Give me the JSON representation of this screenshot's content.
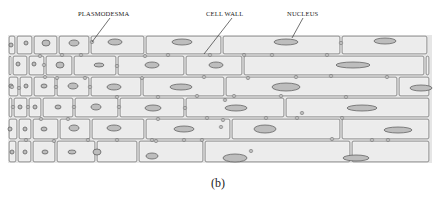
{
  "figure": {
    "caption": "(b)",
    "colors": {
      "tissue_fill": "#e6e6e6",
      "cell_fill": "#ececec",
      "wall_stroke": "#6a6a6a",
      "wall_highlight": "#f7f7f7",
      "nucleus_fill": "#bdbdbd",
      "nucleus_stroke": "#555555",
      "label_text": "#222222"
    },
    "tissue": {
      "x": 8,
      "y": 35,
      "width": 424,
      "height": 128
    },
    "labels": [
      {
        "text": "PLASMODESMA",
        "x": 78,
        "y": 10,
        "line": [
          110,
          18,
          92,
          42
        ]
      },
      {
        "text": "CELL WALL",
        "x": 206,
        "y": 10,
        "line": [
          232,
          18,
          204,
          54
        ]
      },
      {
        "text": "NUCLEUS",
        "x": 287,
        "y": 10,
        "line": [
          303,
          18,
          292,
          38
        ]
      }
    ],
    "rows": [
      {
        "y": 35,
        "h": 20,
        "cells": [
          {
            "x": 8,
            "w": 8,
            "nucleus": [
              11,
              45,
              2,
              2
            ]
          },
          {
            "x": 16,
            "w": 17,
            "nucleus": [
              26,
              43,
              2,
              2
            ]
          },
          {
            "x": 33,
            "w": 25,
            "nucleus": [
              46,
              43,
              4,
              3
            ]
          },
          {
            "x": 58,
            "w": 32,
            "nucleus": [
              74,
              43,
              5,
              3
            ]
          },
          {
            "x": 90,
            "w": 55,
            "nucleus": [
              115,
              42,
              7,
              3
            ]
          },
          {
            "x": 145,
            "w": 77,
            "nucleus": [
              182,
              42,
              10,
              3
            ]
          },
          {
            "x": 222,
            "w": 119,
            "nucleus": [
              286,
              42,
              12,
              3
            ]
          },
          {
            "x": 341,
            "w": 87,
            "nucleus": [
              385,
              41,
              11,
              3
            ]
          }
        ]
      },
      {
        "y": 55,
        "h": 21,
        "cells": [
          {
            "x": 8,
            "w": 4,
            "nucleus": null
          },
          {
            "x": 12,
            "w": 16,
            "nucleus": [
              18,
              64,
              2,
              2
            ]
          },
          {
            "x": 28,
            "w": 17,
            "nucleus": [
              34,
              64,
              2,
              2
            ]
          },
          {
            "x": 45,
            "w": 28,
            "nucleus": [
              60,
              65,
              4,
              3
            ]
          },
          {
            "x": 73,
            "w": 44,
            "nucleus": [
              99,
              65,
              5,
              2
            ]
          },
          {
            "x": 117,
            "w": 68,
            "nucleus": [
              152,
              65,
              7,
              3
            ]
          },
          {
            "x": 185,
            "w": 58,
            "nucleus": [
              216,
              65,
              7,
              3
            ]
          },
          {
            "x": 243,
            "w": 182,
            "nucleus": [
              353,
              65,
              17,
              3
            ]
          },
          {
            "x": 425,
            "w": 5,
            "nucleus": null
          }
        ]
      },
      {
        "y": 76,
        "h": 21,
        "cells": [
          {
            "x": 8,
            "w": 11,
            "nucleus": [
              11,
              86,
              2,
              2
            ]
          },
          {
            "x": 19,
            "w": 14,
            "nucleus": [
              26,
              86,
              2,
              2
            ]
          },
          {
            "x": 33,
            "w": 23,
            "nucleus": [
              44,
              86,
              3,
              2
            ]
          },
          {
            "x": 56,
            "w": 34,
            "nucleus": [
              73,
              86,
              5,
              3
            ]
          },
          {
            "x": 90,
            "w": 52,
            "nucleus": [
              114,
              87,
              7,
              3
            ]
          },
          {
            "x": 142,
            "w": 83,
            "nucleus": [
              181,
              87,
              11,
              3
            ]
          },
          {
            "x": 225,
            "w": 173,
            "nucleus": [
              286,
              87,
              14,
              4
            ]
          },
          {
            "x": 398,
            "w": 32,
            "nucleus": [
              421,
              88,
              11,
              3
            ]
          }
        ]
      },
      {
        "y": 97,
        "h": 21,
        "cells": [
          {
            "x": 8,
            "w": 5,
            "nucleus": null
          },
          {
            "x": 13,
            "w": 15,
            "nucleus": [
              20,
              107,
              2,
              2
            ]
          },
          {
            "x": 28,
            "w": 14,
            "nucleus": [
              35,
              107,
              2,
              2
            ]
          },
          {
            "x": 42,
            "w": 32,
            "nucleus": [
              58,
              107,
              3,
              2
            ]
          },
          {
            "x": 74,
            "w": 45,
            "nucleus": [
              96,
              107,
              5,
              3
            ]
          },
          {
            "x": 119,
            "w": 66,
            "nucleus": [
              153,
              108,
              8,
              3
            ]
          },
          {
            "x": 185,
            "w": 100,
            "nucleus": [
              236,
              108,
              11,
              3
            ]
          },
          {
            "x": 285,
            "w": 145,
            "nucleus": [
              362,
              108,
              15,
              3
            ]
          }
        ]
      },
      {
        "y": 118,
        "h": 22,
        "cells": [
          {
            "x": 8,
            "w": 10,
            "nucleus": [
              10,
              129,
              2,
              2
            ]
          },
          {
            "x": 18,
            "w": 14,
            "nucleus": [
              25,
              129,
              2,
              2
            ]
          },
          {
            "x": 32,
            "w": 27,
            "nucleus": [
              44,
              129,
              3,
              2
            ]
          },
          {
            "x": 59,
            "w": 32,
            "nucleus": [
              74,
              128,
              5,
              3
            ]
          },
          {
            "x": 91,
            "w": 54,
            "nucleus": [
              114,
              128,
              7,
              3
            ]
          },
          {
            "x": 145,
            "w": 86,
            "nucleus": [
              184,
              129,
              10,
              3
            ]
          },
          {
            "x": 231,
            "w": 110,
            "nucleus": [
              265,
              129,
              11,
              4
            ]
          },
          {
            "x": 341,
            "w": 89,
            "nucleus": [
              398,
              130,
              14,
              3
            ]
          }
        ]
      },
      {
        "y": 140,
        "h": 23,
        "cells": [
          {
            "x": 8,
            "w": 9,
            "nucleus": [
              12,
              152,
              2,
              2
            ]
          },
          {
            "x": 17,
            "w": 15,
            "nucleus": [
              25,
              152,
              2,
              2
            ]
          },
          {
            "x": 32,
            "w": 24,
            "nucleus": [
              45,
              152,
              3,
              2
            ]
          },
          {
            "x": 56,
            "w": 40,
            "nucleus": [
              72,
              152,
              4,
              2
            ]
          },
          {
            "x": 96,
            "w": 42,
            "nucleus": [
              97,
              152,
              4,
              3
            ]
          },
          {
            "x": 138,
            "w": 66,
            "nucleus": [
              152,
              156,
              6,
              3
            ]
          },
          {
            "x": 204,
            "w": 147,
            "nucleus": [
              235,
              158,
              12,
              4
            ]
          },
          {
            "x": 351,
            "w": 79,
            "nucleus": [
              356,
              158,
              13,
              3
            ]
          }
        ]
      }
    ],
    "plasmodesmata": [
      [
        92,
        42
      ],
      [
        40,
        56
      ],
      [
        44,
        65
      ],
      [
        62,
        55
      ],
      [
        81,
        55
      ],
      [
        117,
        66
      ],
      [
        145,
        56
      ],
      [
        168,
        55
      ],
      [
        210,
        55
      ],
      [
        244,
        55
      ],
      [
        272,
        55
      ],
      [
        327,
        55
      ],
      [
        341,
        43
      ],
      [
        45,
        77
      ],
      [
        57,
        78
      ],
      [
        85,
        78
      ],
      [
        142,
        78
      ],
      [
        204,
        77
      ],
      [
        248,
        78
      ],
      [
        296,
        77
      ],
      [
        331,
        76
      ],
      [
        387,
        77
      ],
      [
        12,
        87
      ],
      [
        19,
        88
      ],
      [
        56,
        87
      ],
      [
        90,
        87
      ],
      [
        117,
        97
      ],
      [
        158,
        97
      ],
      [
        197,
        96
      ],
      [
        234,
        96
      ],
      [
        281,
        96
      ],
      [
        346,
        97
      ],
      [
        13,
        107
      ],
      [
        28,
        107
      ],
      [
        74,
        107
      ],
      [
        119,
        107
      ],
      [
        185,
        108
      ],
      [
        225,
        100
      ],
      [
        266,
        118
      ],
      [
        297,
        118
      ],
      [
        342,
        118
      ],
      [
        41,
        119
      ],
      [
        68,
        119
      ],
      [
        158,
        119
      ],
      [
        207,
        118
      ],
      [
        223,
        120
      ],
      [
        221,
        127
      ],
      [
        302,
        113
      ],
      [
        332,
        139
      ],
      [
        152,
        140
      ],
      [
        26,
        140
      ],
      [
        54,
        141
      ],
      [
        88,
        140
      ],
      [
        117,
        140
      ],
      [
        156,
        141
      ],
      [
        184,
        140
      ],
      [
        202,
        140
      ],
      [
        372,
        140
      ],
      [
        388,
        140
      ],
      [
        251,
        151
      ]
    ]
  }
}
